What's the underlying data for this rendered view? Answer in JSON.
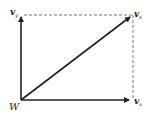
{
  "diagram": {
    "type": "vector-addition",
    "colors": {
      "line": "#222222",
      "dashed": "#555555",
      "background": "#ffffff"
    },
    "origin": {
      "label": "W",
      "x": 21,
      "y": 100
    },
    "vectors": [
      {
        "id": "vertical",
        "label": "v",
        "subscript": "y",
        "from": [
          21,
          100
        ],
        "to": [
          21,
          16
        ]
      },
      {
        "id": "horizontal",
        "label": "v",
        "subscript": "x",
        "from": [
          21,
          100
        ],
        "to": [
          130,
          100
        ]
      },
      {
        "id": "resultant",
        "label": "v",
        "subscript": "s",
        "from": [
          21,
          100
        ],
        "to": [
          131,
          16
        ]
      }
    ],
    "dashed_lines": [
      {
        "from": [
          24,
          15
        ],
        "to": [
          133,
          15
        ]
      },
      {
        "from": [
          133,
          15
        ],
        "to": [
          133,
          100
        ]
      }
    ]
  }
}
